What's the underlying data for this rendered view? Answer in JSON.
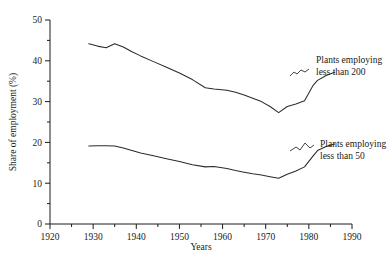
{
  "chart_data": {
    "type": "line",
    "title": "",
    "xlabel": "Years",
    "ylabel": "Share of employment (%)",
    "xlim": [
      1920,
      1990
    ],
    "ylim": [
      0,
      50
    ],
    "xticks": [
      1920,
      1930,
      1940,
      1950,
      1960,
      1970,
      1980,
      1990
    ],
    "xtick_labels": [
      "1920",
      "1930",
      "1940",
      "1950",
      "1960",
      "1970",
      "1980",
      "1990"
    ],
    "xminor_step": 5,
    "yticks": [
      0,
      10,
      20,
      30,
      40,
      50
    ],
    "ytick_labels": [
      "0",
      "10",
      "20",
      "30",
      "40",
      "50"
    ],
    "yminor_step": 5,
    "grid": false,
    "legend_position": "inline-annotation",
    "series": [
      {
        "name": "Plants employing less than 200",
        "annotation": [
          "Plants employing",
          "less than 200"
        ],
        "x": [
          1929,
          1931,
          1933,
          1935,
          1937,
          1939,
          1941,
          1944,
          1947,
          1950,
          1953,
          1956,
          1958,
          1961,
          1963,
          1965,
          1967,
          1969,
          1971,
          1973,
          1975,
          1977,
          1979,
          1981,
          1982,
          1984,
          1986
        ],
        "y": [
          44.2,
          43.6,
          43.2,
          44.2,
          43.4,
          42.2,
          41.2,
          39.8,
          38.4,
          37.0,
          35.4,
          33.4,
          33.1,
          32.8,
          32.3,
          31.6,
          30.8,
          30.0,
          28.8,
          27.3,
          28.8,
          29.4,
          30.2,
          34.0,
          35.2,
          36.4,
          37.2
        ]
      },
      {
        "name": "Plants employing less than 50",
        "annotation": [
          "Plants employing",
          "less than 50"
        ],
        "x": [
          1929,
          1931,
          1933,
          1935,
          1937,
          1939,
          1941,
          1944,
          1947,
          1950,
          1953,
          1956,
          1958,
          1961,
          1963,
          1965,
          1967,
          1969,
          1971,
          1973,
          1975,
          1977,
          1979,
          1981,
          1982,
          1984,
          1986
        ],
        "y": [
          19.1,
          19.2,
          19.2,
          19.1,
          18.6,
          18.0,
          17.4,
          16.7,
          16.0,
          15.3,
          14.5,
          14.0,
          14.1,
          13.6,
          13.1,
          12.7,
          12.3,
          12.0,
          11.6,
          11.2,
          12.2,
          13.0,
          14.0,
          16.7,
          18.0,
          19.0,
          19.6
        ]
      }
    ]
  },
  "geometry": {
    "plot_left": 50,
    "plot_right": 352,
    "plot_bottom": 224,
    "plot_top": 20
  }
}
